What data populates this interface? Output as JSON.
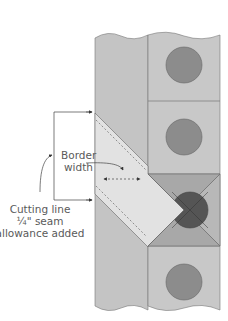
{
  "labels": {
    "border_width_line1": "Border",
    "border_width_line2": "width",
    "cutting_line_line1": "Cutting line",
    "cutting_line_line2": "¼\" seam",
    "cutting_line_line3": "allowance added"
  },
  "colors": {
    "background": "#ffffff",
    "strip_fill": "#c4c4c4",
    "block_fill": "#c8c8c8",
    "border_piece_fill": "#e2e2e2",
    "triangle_dark": "#a8a8a8",
    "triangle_right": "#b8b8b8",
    "circle_fill": "#8c8c8c",
    "circle_dark": "#555555",
    "line": "#6e6e6e",
    "text": "#5a5a5a"
  },
  "blocks": [
    {
      "name": "block-1",
      "circle": "full"
    },
    {
      "name": "block-2",
      "circle": "full"
    },
    {
      "name": "block-3-square-in-square",
      "circle": "partial-dark"
    },
    {
      "name": "block-4",
      "circle": "full"
    }
  ]
}
